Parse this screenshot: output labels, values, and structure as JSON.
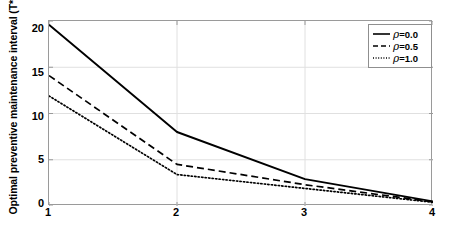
{
  "chart_data": {
    "type": "line",
    "title": "",
    "xlabel": "Acceptable performance level",
    "ylabel": "Optimal preventive maintenance interval (T*)",
    "x": [
      1,
      2,
      3,
      4
    ],
    "xlim": [
      1,
      4
    ],
    "ylim": [
      0,
      20
    ],
    "xticks": [
      "1",
      "2",
      "3",
      "4"
    ],
    "yticks": [
      "0",
      "5",
      "10",
      "15",
      "20"
    ],
    "grid": true,
    "legend_position": "top-right",
    "series": [
      {
        "name": "ρ=0.0",
        "label_prefix": "ρ",
        "label_value": "=0.0",
        "style": "solid",
        "color": "#000000",
        "values": [
          19.6,
          8.0,
          2.9,
          0.5
        ]
      },
      {
        "name": "ρ=0.5",
        "label_prefix": "ρ",
        "label_value": "=0.5",
        "style": "dashed",
        "color": "#000000",
        "values": [
          14.1,
          4.5,
          2.3,
          0.45
        ]
      },
      {
        "name": "ρ=1.0",
        "label_prefix": "ρ",
        "label_value": "=1.0",
        "style": "dotted",
        "color": "#000000",
        "values": [
          11.9,
          3.4,
          1.9,
          0.4
        ]
      }
    ]
  },
  "figure": {
    "background": "#ffffff",
    "axis_color": "#9a9a9a",
    "grid_color": "#e0e0e0",
    "text_color": "#000000"
  }
}
